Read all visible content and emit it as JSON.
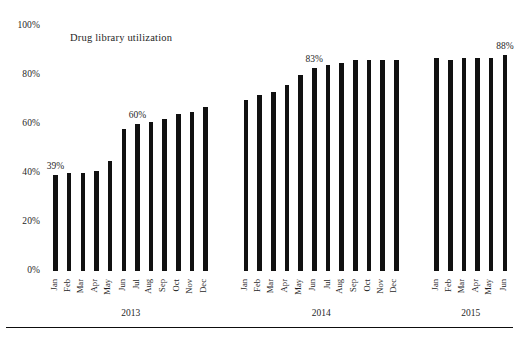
{
  "chart_data": {
    "type": "bar",
    "title": "Drug library utilization",
    "xlabel": "",
    "ylabel": "",
    "ylim": [
      0,
      100
    ],
    "ytick_labels": [
      "0%",
      "20%",
      "40%",
      "60%",
      "80%",
      "100%"
    ],
    "ytick_values": [
      0,
      20,
      40,
      60,
      80,
      100
    ],
    "grid": false,
    "legend": false,
    "unit": "%",
    "groups": [
      {
        "year": "2013",
        "categories": [
          "Jan",
          "Feb",
          "Mar",
          "Apr",
          "May",
          "Jun",
          "Jul",
          "Aug",
          "Sep",
          "Oct",
          "Nov",
          "Dec"
        ],
        "values": [
          39,
          40,
          40,
          41,
          45,
          58,
          60,
          61,
          62,
          64,
          65,
          67
        ]
      },
      {
        "year": "2014",
        "categories": [
          "Jan",
          "Feb",
          "Mar",
          "Apr",
          "May",
          "Jun",
          "Jul",
          "Aug",
          "Sep",
          "Oct",
          "Nov",
          "Dec"
        ],
        "values": [
          70,
          72,
          73,
          76,
          80,
          83,
          84,
          85,
          86,
          86,
          86,
          86
        ]
      },
      {
        "year": "2015",
        "categories": [
          "Jan",
          "Feb",
          "Mar",
          "Apr",
          "May",
          "Jun"
        ],
        "values": [
          87,
          86,
          87,
          87,
          87,
          88
        ]
      }
    ],
    "annotations": [
      {
        "text": "39%",
        "group": 0,
        "index": 0,
        "value": 39
      },
      {
        "text": "60%",
        "group": 0,
        "index": 6,
        "value": 60
      },
      {
        "text": "83%",
        "group": 1,
        "index": 5,
        "value": 83
      },
      {
        "text": "88%",
        "group": 2,
        "index": 5,
        "value": 88
      }
    ],
    "colors": {
      "bar": "#111111",
      "text": "#1f1f1f",
      "background": "#ffffff",
      "rule": "#0d0d0d"
    }
  }
}
